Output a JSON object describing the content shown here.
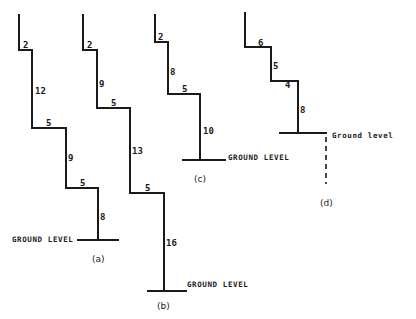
{
  "diagram": {
    "colors": {
      "ink": "#1a1a1a",
      "paper": "#ffffff"
    },
    "figures": [
      {
        "id": "a",
        "caption": "(a)",
        "ground_label": "GROUND LEVEL",
        "labels": [
          "2",
          "12",
          "5",
          "9",
          "5",
          "8"
        ]
      },
      {
        "id": "b",
        "caption": "(b)",
        "ground_label": "GROUND LEVEL",
        "labels": [
          "2",
          "9",
          "5",
          "13",
          "5",
          "16"
        ]
      },
      {
        "id": "c",
        "caption": "(c)",
        "ground_label": "GROUND LEVEL",
        "labels": [
          "2",
          "8",
          "5",
          "10"
        ]
      },
      {
        "id": "d",
        "caption": "(d)",
        "ground_label": "Ground level",
        "labels": [
          "6",
          "5",
          "4",
          "8"
        ]
      }
    ]
  }
}
